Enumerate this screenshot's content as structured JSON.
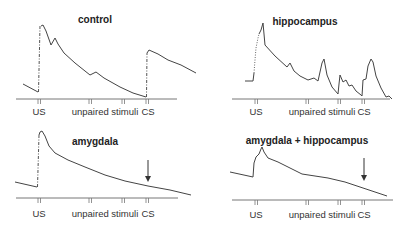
{
  "panels": [
    {
      "title": "control",
      "labels": {
        "us": "US",
        "unpaired": "unpaired stimuli",
        "cs": "CS"
      },
      "arrow": false
    },
    {
      "title": "hippocampus",
      "labels": {
        "us": "US",
        "unpaired": "unpaired stimuli",
        "cs": "CS"
      },
      "arrow": false
    },
    {
      "title": "amygdala",
      "labels": {
        "us": "US",
        "unpaired": "unpaired stimuli",
        "cs": "CS"
      },
      "arrow": true
    },
    {
      "title": "amygdala + hippocampus",
      "labels": {
        "us": "US",
        "unpaired": "unpaired stimuli",
        "cs": "CS"
      },
      "arrow": true
    }
  ],
  "colors": {
    "line": "#444444",
    "axis": "#777777",
    "text": "#222222"
  }
}
